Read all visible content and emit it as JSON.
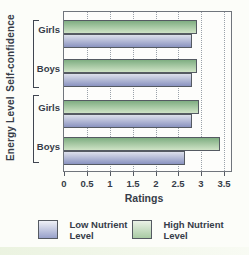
{
  "chart_data": {
    "type": "bar",
    "orientation": "horizontal",
    "xlabel": "Ratings",
    "xlim": [
      0,
      3.65
    ],
    "x_ticks": [
      0,
      0.5,
      1,
      1.5,
      2,
      2.5,
      3,
      3.5
    ],
    "grid": "vertical-dotted",
    "legend_position": "bottom",
    "category_groups": [
      {
        "group": "Self-confidence",
        "categories": [
          "Girls",
          "Boys"
        ]
      },
      {
        "group": "Energy Level",
        "categories": [
          "Girls",
          "Boys"
        ]
      }
    ],
    "bar_order_in_group": [
      "High Nutrient Level",
      "Low Nutrient Level"
    ],
    "series": [
      {
        "name": "High Nutrient Level",
        "color_top": "#7fae82",
        "color_bottom": "#cfe3c6",
        "values": [
          2.9,
          2.9,
          2.95,
          3.4
        ]
      },
      {
        "name": "Low Nutrient Level",
        "color_top": "#dde0eb",
        "color_bottom": "#8a93c0",
        "values": [
          2.8,
          2.8,
          2.8,
          2.65
        ]
      }
    ]
  },
  "legend": {
    "items": [
      {
        "label": "Low Nutrient Level",
        "line1": "Low Nutrient",
        "line2": "Level",
        "color_top": "#eff1f7",
        "color_bottom": "#98a1ca"
      },
      {
        "label": "High Nutrient Level",
        "line1": "High Nutrient",
        "line2": "Level",
        "color_top": "#eaf2e6",
        "color_bottom": "#a9cba4"
      }
    ]
  },
  "colors": {
    "text": "#363c48",
    "grid": "#9aa1a9",
    "plot_border": "#70757c",
    "bar_border": "#555a62",
    "background": "#fcfdf9"
  }
}
